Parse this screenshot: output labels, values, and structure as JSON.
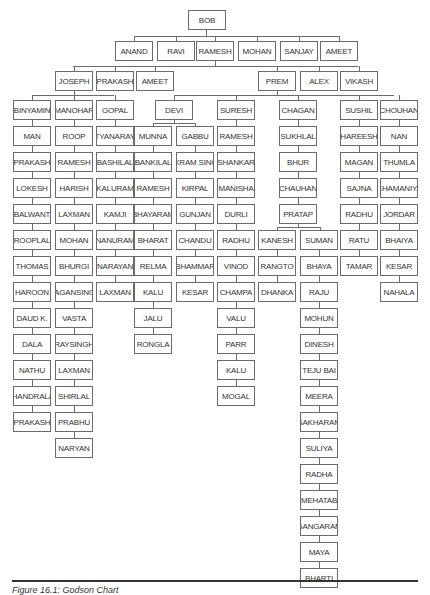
{
  "chart_data": {
    "type": "tree",
    "title": "Godson Chart",
    "root": "BOB",
    "level1": [
      "ANAND",
      "RAVI",
      "RAMESH",
      "MOHAN",
      "SANJAY",
      "AMEET"
    ],
    "level2_left": [
      "JOSEPH",
      "PRAKASH",
      "AMEET"
    ],
    "level2_right": [
      "PREM",
      "ALEX",
      "VIKASH"
    ],
    "level3": [
      "BINYAMIN",
      "MANOHAR",
      "GOPAL",
      "DEVI",
      "SURESH",
      "CHAGAN",
      "SUSHIL",
      "CHOUHAN"
    ],
    "chains": {
      "BINYAMIN": [
        "MAN",
        "PRAKASH",
        "LOKESH",
        "BALWANT",
        "ROOPLAL",
        "THOMAS",
        "HAROON",
        "DAUD K.",
        "DALA",
        "NATHU",
        "CHANDRALAL",
        "PRAKASH"
      ],
      "MANOHAR": [
        "ROOP",
        "RAMESH",
        "HARISH",
        "LAXMAN",
        "MOHAN",
        "BHURGI",
        "MAGANSINGH",
        "VASTA",
        "RAYSINGH",
        "LAXMAN",
        "SHIRLAL",
        "PRABHU",
        "NARYAN"
      ],
      "GOPAL": [
        "SATYANARAYAN",
        "BASHILAL",
        "KALURAM",
        "KAMJI",
        "NANURAM",
        "NARAYAN",
        "LAXMAN"
      ],
      "DEVI>MUNNA": [
        "MUNNA",
        "BANKILAL",
        "RAMESH",
        "BHAYARAM",
        "BHARAT",
        "RELMA",
        "KALU",
        "JALU",
        "RONGLA"
      ],
      "DEVI>GABBU": [
        "GABBU",
        "VIKRAM SINGH",
        "KIRPAL",
        "GUNJAN",
        "CHANDU",
        "BHAMMAR",
        "KESAR"
      ],
      "SURESH": [
        "RAMESH",
        "SHANKAR",
        "MANISHA",
        "DURLI",
        "RADHU",
        "VINOD",
        "CHAMPA",
        "VALU",
        "PARR",
        "KALU",
        "MOGAL"
      ],
      "CHAGAN": [
        "SUKHLAL",
        "BHUR",
        "CHAUHAN",
        "PRATAP"
      ],
      "PRATAP>KANESH": [
        "KANESH",
        "RANGTO",
        "DHANKA"
      ],
      "PRATAP>SUMAN": [
        "SUMAN",
        "BHAYA",
        "RAJU",
        "MOHUN",
        "DINESH",
        "TEJU BAI",
        "MEERA",
        "SAKHARAM",
        "SULIYA",
        "RADHA",
        "MEHATAB",
        "GANGARAM",
        "MAYA",
        "BHARTI"
      ],
      "SUSHIL": [
        "HAREESH",
        "MAGAN",
        "SAJNA",
        "RADHU",
        "RATU",
        "TAMAR"
      ],
      "CHOUHAN": [
        "NAN",
        "THUMLA",
        "CHAMANIYA",
        "JORDAR",
        "BHAIYA",
        "KESAR",
        "NAHALA"
      ]
    }
  },
  "caption": "Figure 16.1: Godson Chart"
}
